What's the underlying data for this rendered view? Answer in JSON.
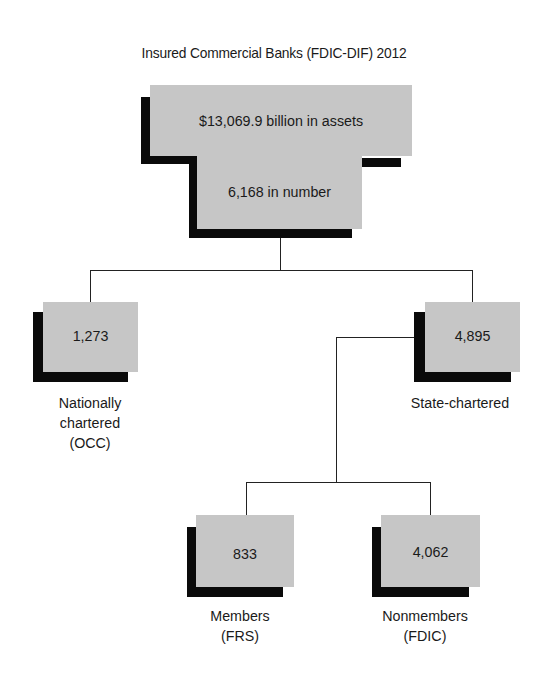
{
  "title": "Insured Commercial Banks (FDIC-DIF) 2012",
  "root": {
    "assets": "$13,069.9 billion in assets",
    "number": "6,168 in number"
  },
  "children": [
    {
      "value": "1,273",
      "label_lines": [
        "Nationally",
        "chartered",
        "(OCC)"
      ]
    },
    {
      "value": "4,895",
      "label_lines": [
        "State-chartered"
      ],
      "children": [
        {
          "value": "833",
          "label_lines": [
            "Members",
            "(FRS)"
          ]
        },
        {
          "value": "4,062",
          "label_lines": [
            "Nonmembers",
            "(FDIC)"
          ]
        }
      ]
    }
  ],
  "colors": {
    "box_fill": "#c6c6c6",
    "shadow": "#0a0a0a",
    "line": "#222222"
  }
}
